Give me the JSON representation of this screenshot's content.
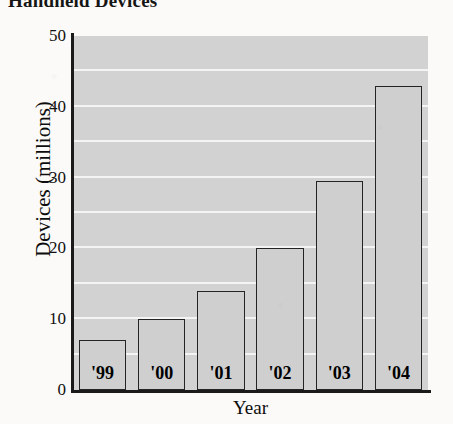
{
  "chart_data": {
    "type": "bar",
    "title": "Handheld Devices",
    "xlabel": "Year",
    "ylabel": "Devices (millions)",
    "categories": [
      "'99",
      "'00",
      "'01",
      "'02",
      "'03",
      "'04"
    ],
    "values": [
      7,
      10,
      14,
      20,
      29.5,
      43
    ],
    "ylim": [
      0,
      50
    ],
    "y_ticks": [
      50,
      40,
      30,
      20,
      10,
      0
    ],
    "gridline_values": [
      45,
      40,
      35,
      30,
      25,
      20,
      15,
      10,
      5
    ],
    "grid": true,
    "legend": "none",
    "category_labels_inside_bars": true,
    "colors": {
      "plot_background": "#d2d2d2",
      "bar_fill": "#cfcfcf",
      "bar_outline": "#242424",
      "gridline": "#f4f4f4",
      "axis": "#1a1a1a",
      "page_background": "#fbfaf8",
      "text": "#000000"
    }
  }
}
